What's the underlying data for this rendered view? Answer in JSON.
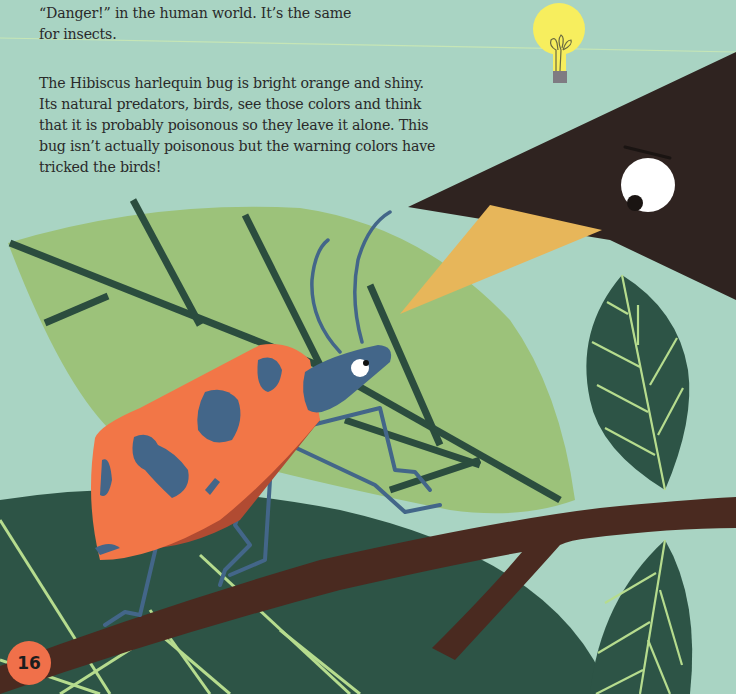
{
  "page": {
    "intro_lines": [
      "“Danger!” in the human world. It’s the same",
      "for insects."
    ],
    "body_lines": [
      "The Hibiscus harlequin bug is bright orange and shiny.",
      "Its natural predators, birds, see those colors and think",
      "that it is probably poisonous so they leave it alone. This",
      "bug isn’t actually poisonous but the warning colors have",
      "tricked the birds!"
    ],
    "page_number": "16"
  },
  "illustration": {
    "subjects": [
      "lightbulb-icon",
      "bird-head",
      "hibiscus-harlequin-bug",
      "branch",
      "leaves"
    ],
    "colors": {
      "background": "#a9d4c3",
      "light_leaf": "#9cc27a",
      "dark_leaf": "#2d5446",
      "vein_dark": "#2b4d3e",
      "vein_light": "#b6dc8e",
      "branch": "#4a2a20",
      "bird": "#2f2320",
      "beak": "#e7b65a",
      "bug_orange": "#f27647",
      "bug_shadow": "#b14b32",
      "bug_blue": "#436689",
      "bulb_yellow": "#f7ee5e",
      "bulb_base": "#7f7b82",
      "page_badge": "#f0704a"
    }
  }
}
